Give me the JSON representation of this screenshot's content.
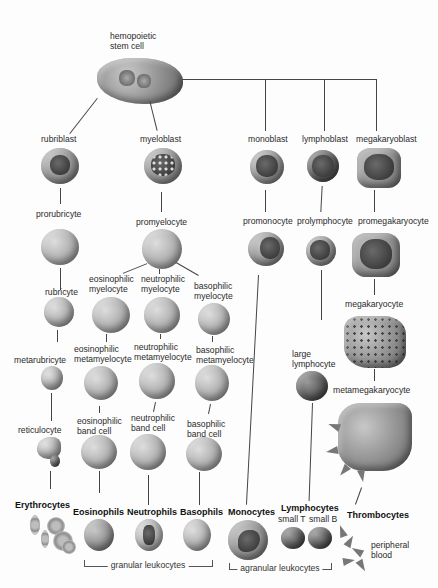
{
  "diagram": {
    "type": "hematopoiesis-lineage-tree",
    "root": {
      "label": "hemopoietic\nstem cell",
      "line1": "hemopoietic",
      "line2": "stem cell"
    },
    "lineages": {
      "erythrocyte": {
        "stages": [
          "rubriblast",
          "prorubricyte",
          "rubricyte",
          "metarubricyte",
          "reticulocyte"
        ],
        "final": "Erythrocytes"
      },
      "granulocyte": {
        "blast": "myeloblast",
        "pro": "promyelocyte",
        "eosinophil": {
          "myelocyte": [
            "eosinophilic",
            "myelocyte"
          ],
          "metamyelocyte": [
            "eosinophilic",
            "metamyelocyte"
          ],
          "band": [
            "eosinophilic",
            "band cell"
          ],
          "final": "Eosinophils"
        },
        "neutrophil": {
          "myelocyte": [
            "neutrophilic",
            "myelocyte"
          ],
          "metamyelocyte": [
            "neutrophilic",
            "metamyelocyte"
          ],
          "band": [
            "neutrophilic",
            "band cell"
          ],
          "final": "Neutrophils"
        },
        "basophil": {
          "myelocyte": [
            "basophilic",
            "myelocyte"
          ],
          "metamyelocyte": [
            "basophilic",
            "metamyelocyte"
          ],
          "band": [
            "basophilic",
            "band cell"
          ],
          "final": "Basophils"
        }
      },
      "monocyte": {
        "stages": [
          "monoblast",
          "promonocyte"
        ],
        "final": "Monocytes"
      },
      "lymphocyte": {
        "stages": [
          "lymphoblast",
          "prolymphocyte"
        ],
        "large": [
          "large",
          "lymphocyte"
        ],
        "final": "Lymphocytes",
        "subtypes": [
          "small T",
          "small B"
        ]
      },
      "thrombocyte": {
        "stages": [
          "megakaryoblast",
          "promegakaryocyte",
          "megakaryocyte",
          "metamegakaryocyte"
        ],
        "final": "Thrombocytes",
        "note": [
          "peripheral",
          "blood"
        ]
      }
    },
    "groups": {
      "granular": "granular leukocytes",
      "agranular": "agranular leukocytes"
    }
  }
}
